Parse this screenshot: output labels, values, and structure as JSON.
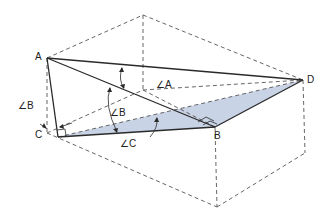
{
  "figure": {
    "colors": {
      "line": "#2a2a2a",
      "hidden": "#555555",
      "shade": "#c9d3e6",
      "background": "#ffffff"
    },
    "points": {
      "A": "A",
      "B": "B",
      "C": "C",
      "D": "D"
    },
    "angles": {
      "angle_A": "∠A",
      "angle_B_upper": "∠B",
      "angle_B_left": "∠B",
      "angle_C": "∠C"
    }
  }
}
